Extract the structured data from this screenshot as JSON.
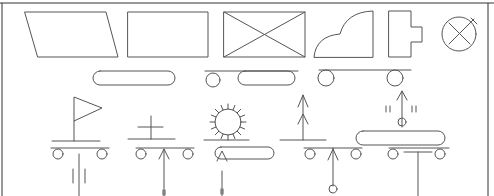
{
  "diagram": {
    "colors": {
      "stroke": "#555555",
      "frame_top": "#333333",
      "frame_left": "#444444",
      "frame_right": "#888888",
      "background": "#ffffff"
    },
    "frame": {
      "top": [
        0,
        3,
        494,
        3
      ],
      "left": [
        2,
        3,
        2,
        196
      ],
      "right": [
        488,
        3,
        488,
        196
      ]
    },
    "symbols": [
      {
        "name": "parallelogram",
        "path": "M25 12 L106 12 L118 57 L38 57 Z"
      },
      {
        "name": "rectangle",
        "path": "M128 12 L208 12 L208 57 L128 57 Z"
      },
      {
        "name": "crossed-rectangle",
        "path": "M224 12 L305 12 L305 57 L224 57 Z M224 12 L305 57 M305 12 L224 57"
      },
      {
        "name": "quarter-cloud-shape",
        "path": "M314 57 Q316 36 340 34 Q346 12 373 11 L373 57 Z"
      },
      {
        "name": "tab-block",
        "path": "M389 11 L411 11 L411 27 L422 27 L422 42 L411 42 L411 57 L389 57 Z"
      },
      {
        "name": "crossed-circle-with-stem",
        "path": "M449 23 L470 44 M470 23 L449 44 M469 24 L470 23 M466 27 L474 19 M471 18 L477 24"
      },
      {
        "name": "stadium-pill",
        "path": "M100 71 L168 71 A7 7 0 0 1 168 85 L100 85 A7 7 0 0 1 100 71 Z"
      },
      {
        "name": "pill-with-wheel-line",
        "path": "M205 71 L298 71 M245 71 L288 71 A7 7 0 0 1 288 85 L245 85 A7 7 0 0 1 245 71 Z"
      },
      {
        "name": "wheel-line-pair",
        "path": "M319 70 L411 70"
      },
      {
        "name": "flag-cart",
        "path": "M74 141 L74 97 L102 108 L74 121 M52 141 L100 141 M51 148 L109 148 M79 154 L79 196 M73 169 L73 183 M85 169 L85 183"
      },
      {
        "name": "cross-cart",
        "path": "M138 127 L163 127 M151 116 L151 139 M128 139 L175 139 M136 148 L194 148 M164 196 L164 149 M159 159 L164 149 L169 159 M163 190 L163 195 M165 190 L165 195"
      },
      {
        "name": "sun-pill",
        "path": "M204 140 L249 140 M222 171 L222 196 M217 161 L222 151 L227 161 M221 189 L221 194 M223 189 L223 194"
      },
      {
        "name": "arrow-bar-arrow-cart",
        "path": "M280 140 L326 140 M303 140 L303 95 M298 107 L303 95 L308 107 M298 124 L303 114 L308 124 M304 148 L362 148 M333 148 L333 186 M328 160 L333 149 L338 160"
      },
      {
        "name": "pill-arrow-t-cart",
        "path": "M363 131 L438 131 A7 7 0 0 1 438 145 L363 145 A7 7 0 0 1 363 131 Z M402 127 L402 91 M397 100 L402 91 L407 100 M386 106 L386 112 M390 106 L390 112 M412 106 L412 112 M416 106 L416 112 M389 148 L449 148 M404 152 L432 152 M418 152 L418 196"
      }
    ],
    "circles": [
      {
        "name": "crossed-circle",
        "cx": 459,
        "cy": 34,
        "r": 17
      },
      {
        "name": "wheel",
        "cx": 213,
        "cy": 80,
        "r": 7
      },
      {
        "name": "wheel",
        "cx": 326,
        "cy": 78,
        "r": 8
      },
      {
        "name": "wheel",
        "cx": 395,
        "cy": 78,
        "r": 8
      },
      {
        "name": "wheel",
        "cx": 58,
        "cy": 154,
        "r": 5
      },
      {
        "name": "wheel",
        "cx": 102,
        "cy": 154,
        "r": 5
      },
      {
        "name": "wheel",
        "cx": 141,
        "cy": 154,
        "r": 5
      },
      {
        "name": "wheel",
        "cx": 188,
        "cy": 154,
        "r": 5
      },
      {
        "name": "sun-circle",
        "cx": 228,
        "cy": 122,
        "r": 13
      },
      {
        "name": "wheel",
        "cx": 310,
        "cy": 154,
        "r": 5
      },
      {
        "name": "wheel",
        "cx": 356,
        "cy": 154,
        "r": 5
      },
      {
        "name": "end-circle",
        "cx": 333,
        "cy": 189,
        "r": 4
      },
      {
        "name": "top-circle",
        "cx": 402,
        "cy": 122,
        "r": 4
      },
      {
        "name": "wheel",
        "cx": 393,
        "cy": 154,
        "r": 5
      },
      {
        "name": "wheel",
        "cx": 440,
        "cy": 154,
        "r": 5
      }
    ],
    "pills": [
      {
        "name": "sun-pill-body",
        "path": "M221 147 L268 147 A6 6 0 0 1 268 159 L221 159 A6 6 0 0 1 221 147 Z"
      }
    ],
    "sun_rays": {
      "cx": 228,
      "cy": 122,
      "r_inner": 13,
      "r_outer": 18,
      "count": 16
    }
  }
}
